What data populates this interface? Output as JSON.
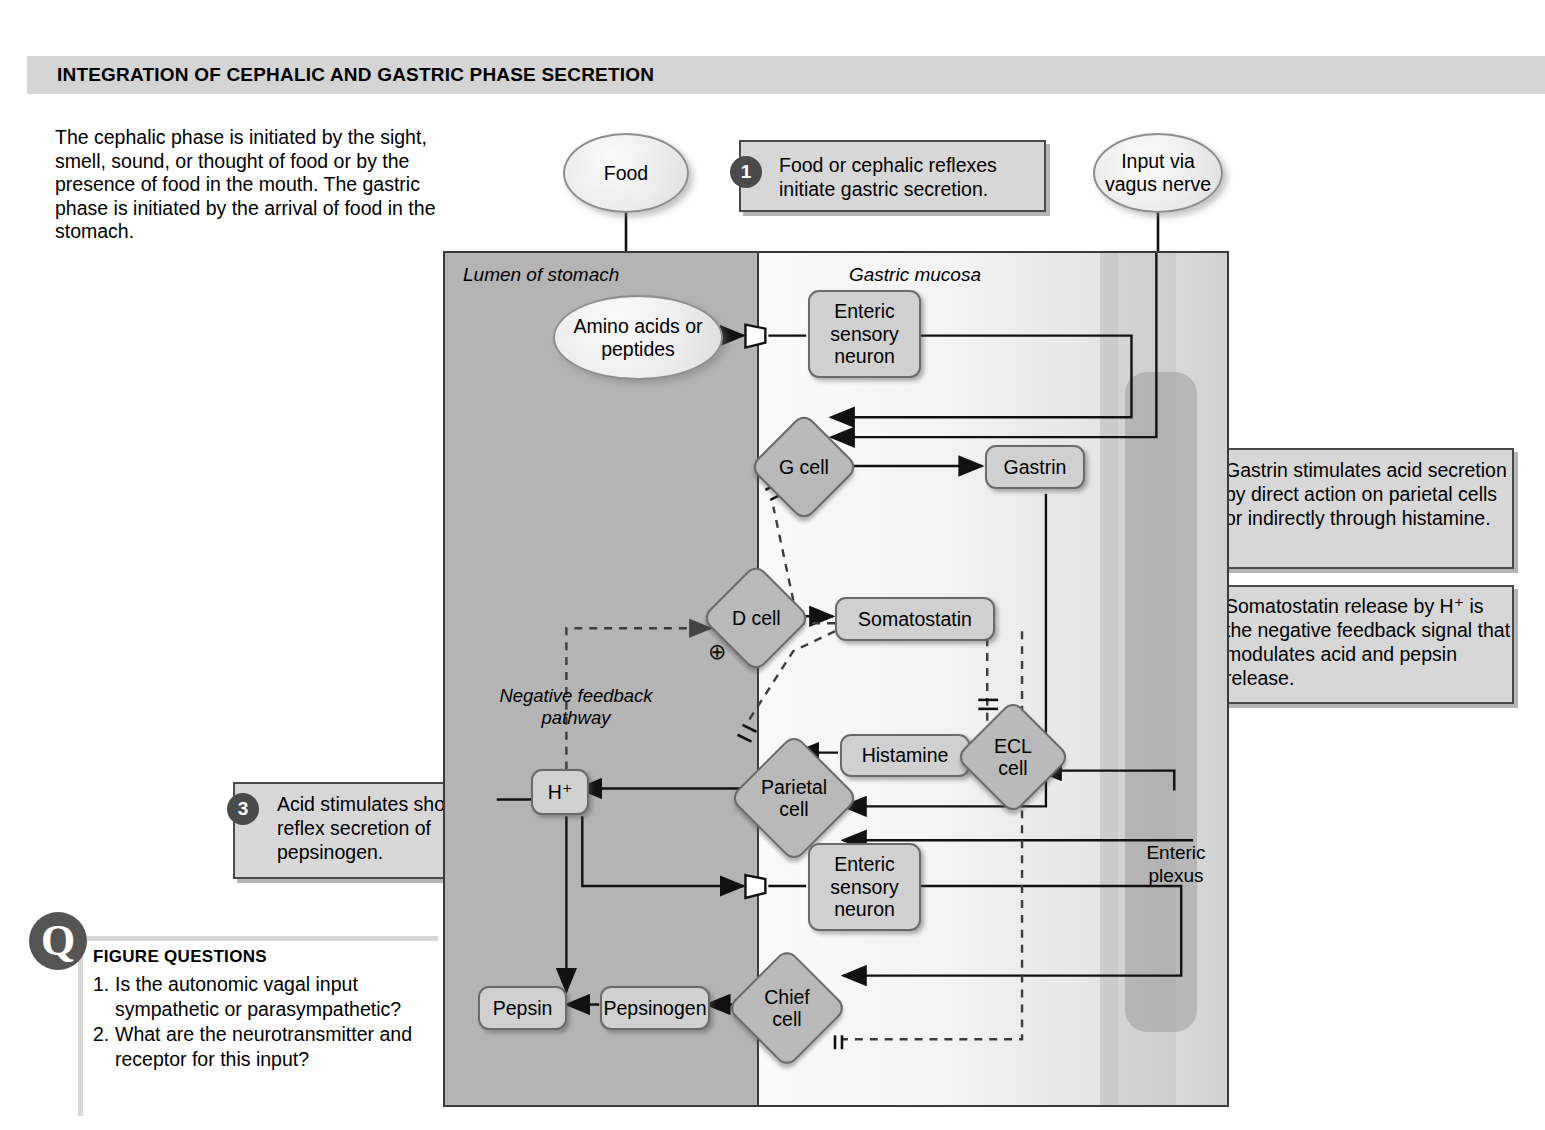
{
  "header": {
    "title": "INTEGRATION OF CEPHALIC AND GASTRIC PHASE SECRETION"
  },
  "intro": {
    "text": "The cephalic phase is initiated by the sight, smell, sound, or thought of food or by the presence of food in the mouth. The gastric phase is initiated by the arrival of food in the stomach."
  },
  "callouts": [
    {
      "number": "1",
      "text": "Food or cephalic reflexes initiate gastric secretion."
    },
    {
      "number": "2",
      "text": "Gastrin stimulates acid secretion by direct action on parietal cells or indirectly through histamine."
    },
    {
      "number": "3",
      "text": "Acid stimulates short reflex secretion of pepsinogen."
    },
    {
      "number": "4",
      "text": "Somatostatin release by H⁺ is the negative feedback signal that modulates acid and pepsin release."
    }
  ],
  "diagram": {
    "region_labels": {
      "lumen": "Lumen of stomach",
      "mucosa": "Gastric mucosa",
      "plexus": "Enteric plexus",
      "negative_feedback": "Negative feedback pathway"
    },
    "external_nodes": [
      {
        "id": "food",
        "label": "Food",
        "shape": "oval"
      },
      {
        "id": "vagus",
        "label": "Input via vagus nerve",
        "shape": "oval"
      }
    ],
    "nodes": [
      {
        "id": "amino",
        "label": "Amino acids or peptides",
        "shape": "oval"
      },
      {
        "id": "sensory-top",
        "label": "Enteric sensory neuron",
        "shape": "rounded-box"
      },
      {
        "id": "gcell",
        "label": "G cell",
        "shape": "diamond"
      },
      {
        "id": "gastrin",
        "label": "Gastrin",
        "shape": "rounded-box"
      },
      {
        "id": "dcell",
        "label": "D cell",
        "shape": "diamond"
      },
      {
        "id": "somatostatin",
        "label": "Somatostatin",
        "shape": "rounded-box"
      },
      {
        "id": "histamine",
        "label": "Histamine",
        "shape": "rounded-box"
      },
      {
        "id": "ecl",
        "label": "ECL cell",
        "shape": "diamond"
      },
      {
        "id": "parietal",
        "label": "Parietal cell",
        "shape": "diamond"
      },
      {
        "id": "hplus",
        "label": "H⁺",
        "shape": "rounded-box"
      },
      {
        "id": "sensory-bottom",
        "label": "Enteric sensory neuron",
        "shape": "rounded-box"
      },
      {
        "id": "chief",
        "label": "Chief cell",
        "shape": "diamond"
      },
      {
        "id": "pepsinogen",
        "label": "Pepsinogen",
        "shape": "rounded-box"
      },
      {
        "id": "pepsin",
        "label": "Pepsin",
        "shape": "rounded-box"
      }
    ],
    "symbols": {
      "plus": "⊕"
    }
  },
  "figure_questions": {
    "badge": "Q",
    "heading": "FIGURE QUESTIONS",
    "items": [
      {
        "num": "1.",
        "text": "Is the autonomic vagal input sympathetic or parasympathetic?"
      },
      {
        "num": "2.",
        "text": "What are the neurotransmitter and receptor for this input?"
      }
    ]
  },
  "colors": {
    "header_bar": "#d5d5d5",
    "callout_fill": "#d7d7d7",
    "callout_border": "#4a4a4a",
    "step_badge": "#4a4a4a",
    "lumen_fill": "#b4b4b4",
    "mucosa_fill": "#f4f4f4",
    "node_fill": "#d0d0d0",
    "diamond_fill": "#b9b9b9",
    "line": "#111111"
  }
}
